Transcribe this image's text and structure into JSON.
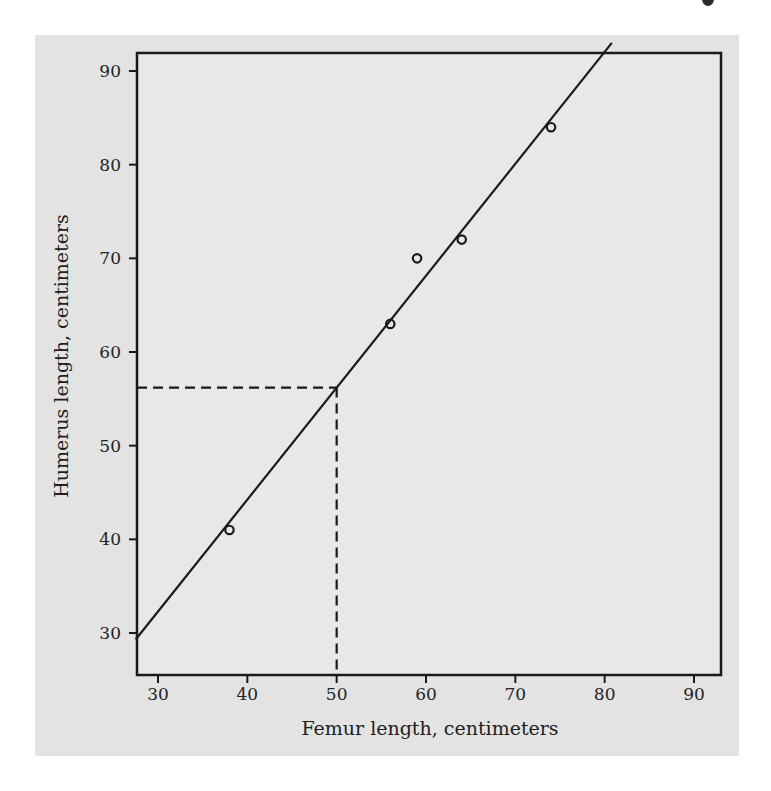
{
  "chart_data": {
    "type": "scatter",
    "title": "",
    "xlabel": "Femur length, centimeters",
    "ylabel": "Humerus length, centimeters",
    "xlim": [
      27.5,
      93
    ],
    "ylim": [
      27.5,
      92
    ],
    "xticks": [
      30,
      40,
      50,
      60,
      70,
      80,
      90
    ],
    "yticks": [
      30,
      40,
      50,
      60,
      70,
      80,
      90
    ],
    "grid": false,
    "legend": null,
    "series": [
      {
        "name": "Observations",
        "marker": "open-circle",
        "points": [
          {
            "x": 38,
            "y": 41
          },
          {
            "x": 56,
            "y": 63
          },
          {
            "x": 59,
            "y": 70
          },
          {
            "x": 64,
            "y": 72
          },
          {
            "x": 74,
            "y": 84
          }
        ]
      }
    ],
    "regression_line": {
      "intercept": -3.66,
      "slope": 1.197,
      "from": {
        "x": 27.5,
        "y": 29.3
      },
      "to": {
        "x": 80.8,
        "y": 93
      }
    },
    "annotations": [
      {
        "type": "dashed-guide",
        "x": 50,
        "y": 56.2,
        "description": "Predicted humerus length for femur = 50 cm"
      }
    ]
  },
  "colors": {
    "panel_background": "#e4e4e4",
    "plot_background": "#e9e9e9",
    "ink": "#1a1a1a"
  }
}
